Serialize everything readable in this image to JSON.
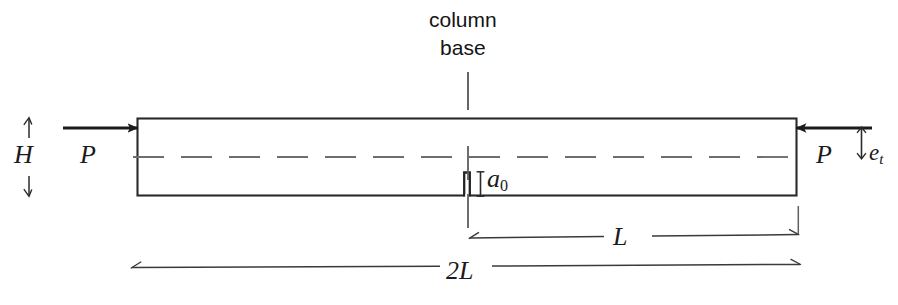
{
  "figure": {
    "type": "engineering-diagram",
    "canvas": {
      "width": 898,
      "height": 305
    },
    "colors": {
      "ink": "#1b1b1b",
      "outline": "#2a2a2a",
      "centerline": "#6e6e6e",
      "dimension": "#3a3a3a",
      "background": "#ffffff"
    },
    "annotations": {
      "column_base": "column\nbase",
      "column_base_line1": "column",
      "column_base_line2": "base",
      "height_label": "H",
      "load_left_label": "P",
      "load_right_label": "P",
      "eccentricity_label": "e",
      "eccentricity_subscript": "t",
      "crack_label": "a",
      "crack_subscript": "0",
      "half_length_label": "L",
      "full_length_label": "2L"
    },
    "geometry": {
      "beam": {
        "x": 137,
        "y": 118,
        "width": 660,
        "height": 78
      },
      "centerline_y": 157,
      "column_base_x": 468,
      "crack": {
        "x": 464,
        "y": 172,
        "width": 6,
        "height": 24
      },
      "dimension_L": {
        "x1": 468,
        "x2": 798,
        "y": 238
      },
      "dimension_2L": {
        "x1": 131,
        "x2": 800,
        "y": 267
      },
      "arrow_left": {
        "x1": 64,
        "x2": 137,
        "y": 128
      },
      "arrow_right": {
        "x1": 870,
        "x2": 797,
        "y": 128
      },
      "height_bracket": {
        "x": 29,
        "y1": 118,
        "y2": 196
      },
      "eccentricity_bracket": {
        "x": 861,
        "y1": 128,
        "y2": 157
      }
    }
  }
}
